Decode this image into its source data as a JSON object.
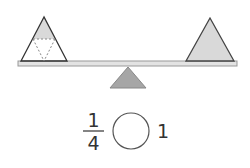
{
  "diagram": {
    "left_pan": {
      "shape": "triangle",
      "detail": "divided into 4 equal triangles, top 1 shaded",
      "fill": "#ffffff",
      "shaded_fill": "#d9d9d9"
    },
    "right_pan": {
      "shape": "triangle",
      "fill": "#d9d9d9"
    },
    "fulcrum_color": "#a6a6a6",
    "plank_color": "#e3e3e3",
    "stroke_color": "#333333"
  },
  "comparison": {
    "left_fraction": {
      "numerator": "1",
      "denominator": "4"
    },
    "blank": "",
    "right_value": "1"
  }
}
